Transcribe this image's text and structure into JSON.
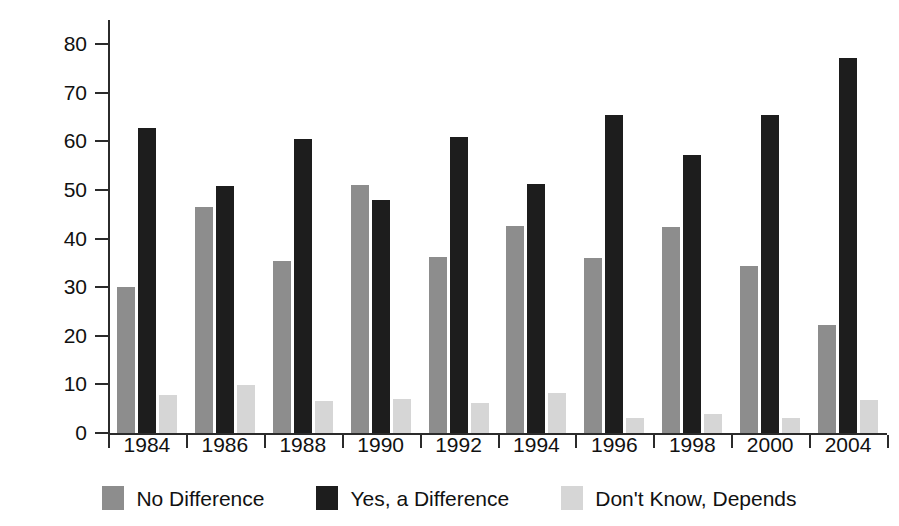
{
  "chart_data": {
    "type": "bar",
    "title": "",
    "subtitle": "",
    "xlabel": "",
    "ylabel": "Percentage",
    "categories": [
      "1984",
      "1986",
      "1988",
      "1990",
      "1992",
      "1994",
      "1996",
      "1998",
      "2000",
      "2004"
    ],
    "ylim": [
      0,
      85
    ],
    "yticks": [
      0,
      10,
      20,
      30,
      40,
      50,
      60,
      70,
      80
    ],
    "ytick_labels": [
      "0",
      "10",
      "20",
      "30",
      "40",
      "50",
      "60",
      "70",
      "80"
    ],
    "grid": false,
    "legend_position": "bottom",
    "series": [
      {
        "name": "No Difference",
        "color": "#8d8d8d",
        "values": [
          30.0,
          46.5,
          35.3,
          51.0,
          36.2,
          42.7,
          36.1,
          42.4,
          34.4,
          22.2
        ]
      },
      {
        "name": "Yes, a Difference",
        "color": "#1d1d1d",
        "values": [
          62.7,
          50.9,
          60.5,
          48.0,
          61.0,
          51.2,
          65.4,
          57.2,
          65.5,
          77.2
        ]
      },
      {
        "name": "Don't Know, Depends",
        "color": "#d6d6d6",
        "values": [
          7.8,
          9.9,
          6.5,
          7.0,
          6.2,
          8.2,
          3.0,
          3.9,
          3.1,
          6.7
        ]
      }
    ]
  },
  "legend": {
    "items": [
      {
        "label": "No Difference",
        "swatch": "s0"
      },
      {
        "label": "Yes, a Difference",
        "swatch": "s1"
      },
      {
        "label": "Don't Know, Depends",
        "swatch": "s2"
      }
    ]
  }
}
